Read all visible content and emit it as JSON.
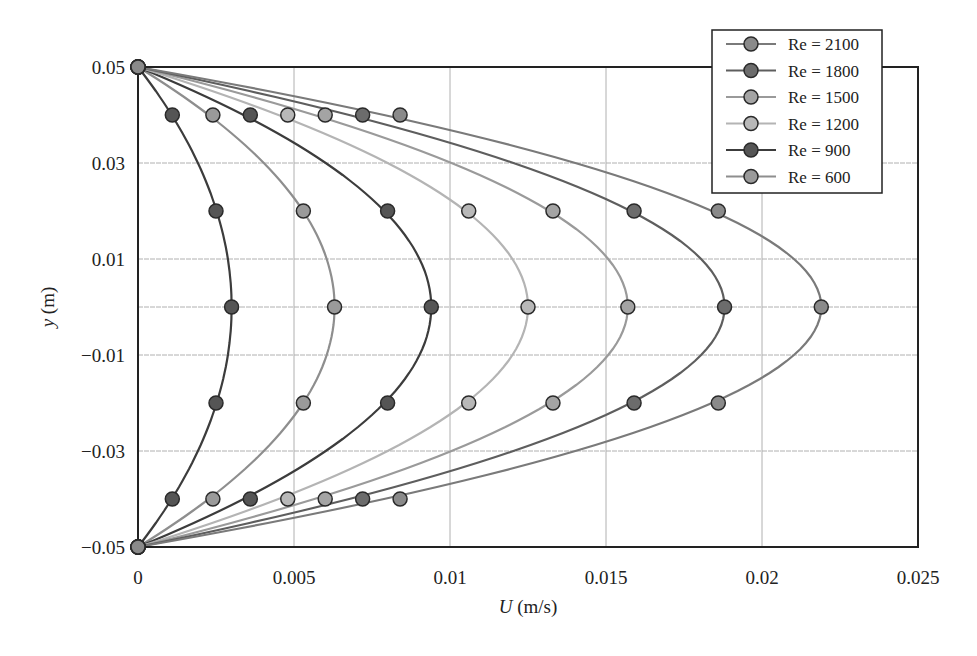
{
  "chart_data": {
    "type": "line",
    "title": "",
    "xlabel_italic": "U",
    "xlabel_unit": " (m/s)",
    "xlabel": "U (m/s)",
    "ylabel_italic": "y",
    "ylabel_unit": " (m)",
    "ylabel": "y (m)",
    "xlim": [
      0,
      0.025
    ],
    "ylim": [
      -0.05,
      0.05
    ],
    "x_ticks": [
      "0",
      "0.005",
      "0.01",
      "0.015",
      "0.02",
      "0.025"
    ],
    "x_tick_values": [
      0,
      0.005,
      0.01,
      0.015,
      0.02,
      0.025
    ],
    "y_ticks": [
      "0.05",
      "0.03",
      "0.01",
      "−0.01",
      "−0.03",
      "−0.05"
    ],
    "y_tick_values": [
      0.05,
      0.03,
      0.01,
      -0.01,
      -0.03,
      -0.05
    ],
    "grid": true,
    "grid_y_values": [
      0.03,
      0.01,
      0,
      -0.01,
      -0.03
    ],
    "grid_x_values": [
      0.005,
      0.01,
      0.015,
      0.02
    ],
    "legend_position": "upper right",
    "y": [
      0.05,
      0.04,
      0.02,
      0,
      -0.02,
      -0.04,
      -0.05
    ],
    "series": [
      {
        "name": "",
        "in_legend": false,
        "line_color": "#3c3c3c",
        "marker_color": "#555555",
        "values": [
          0,
          0.0011,
          0.0025,
          0.003,
          0.0025,
          0.0011,
          0
        ]
      },
      {
        "name": "Re = 600",
        "in_legend": true,
        "line_color": "#8e8e8e",
        "marker_color": "#9a9a9a",
        "values": [
          0,
          0.0024,
          0.0053,
          0.0063,
          0.0053,
          0.0024,
          0
        ]
      },
      {
        "name": "Re = 900",
        "in_legend": true,
        "line_color": "#3c3c3c",
        "marker_color": "#555555",
        "values": [
          0,
          0.0036,
          0.008,
          0.0094,
          0.008,
          0.0036,
          0
        ]
      },
      {
        "name": "Re = 1200",
        "in_legend": true,
        "line_color": "#b4b4b4",
        "marker_color": "#b8b8b8",
        "values": [
          0,
          0.0048,
          0.0106,
          0.0125,
          0.0106,
          0.0048,
          0
        ]
      },
      {
        "name": "Re = 1500",
        "in_legend": true,
        "line_color": "#9a9a9a",
        "marker_color": "#a4a4a4",
        "values": [
          0,
          0.006,
          0.0133,
          0.0157,
          0.0133,
          0.006,
          0
        ]
      },
      {
        "name": "Re = 1800",
        "in_legend": true,
        "line_color": "#5e5e5e",
        "marker_color": "#6c6c6c",
        "values": [
          0,
          0.0072,
          0.0159,
          0.0188,
          0.0159,
          0.0072,
          0
        ]
      },
      {
        "name": "Re = 2100",
        "in_legend": true,
        "line_color": "#7a7a7a",
        "marker_color": "#8a8a8a",
        "values": [
          0,
          0.0084,
          0.0186,
          0.0219,
          0.0186,
          0.0084,
          0
        ]
      }
    ],
    "legend": [
      {
        "label": "Re = 2100",
        "line_color": "#7a7a7a",
        "marker_color": "#8a8a8a"
      },
      {
        "label": "Re = 1800",
        "line_color": "#5e5e5e",
        "marker_color": "#6c6c6c"
      },
      {
        "label": "Re = 1500",
        "line_color": "#9a9a9a",
        "marker_color": "#a4a4a4"
      },
      {
        "label": "Re = 1200",
        "line_color": "#b4b4b4",
        "marker_color": "#b8b8b8"
      },
      {
        "label": "Re = 900",
        "line_color": "#3c3c3c",
        "marker_color": "#555555"
      },
      {
        "label": "Re = 600",
        "line_color": "#8e8e8e",
        "marker_color": "#9a9a9a"
      }
    ]
  }
}
